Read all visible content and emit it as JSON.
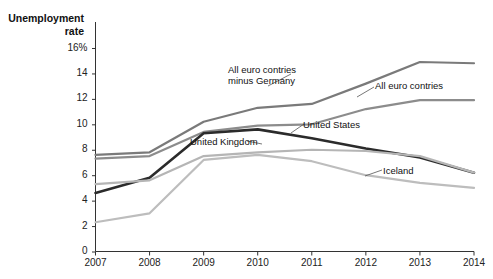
{
  "top_partial_text": "",
  "axis_title": {
    "line1": "Unemployment",
    "line2": "rate"
  },
  "chart_data": {
    "type": "line",
    "title": "",
    "subtitle": "",
    "xlabel": "",
    "ylabel": "Unemployment rate",
    "x": [
      2007,
      2008,
      2009,
      2010,
      2011,
      2012,
      2013,
      2014
    ],
    "xtick_labels": [
      "2007",
      "2008",
      "2009",
      "2010",
      "2011",
      "2012",
      "2013",
      "2014"
    ],
    "ytick_labels": [
      "0",
      "2",
      "4",
      "6",
      "8",
      "10",
      "12",
      "14",
      "16%"
    ],
    "ytick_values": [
      0,
      2,
      4,
      6,
      8,
      10,
      12,
      14,
      16
    ],
    "ylim": [
      0,
      16.8
    ],
    "xlim": [
      2007,
      2014
    ],
    "grid": false,
    "legend": "inline-annotations",
    "series": [
      {
        "name": "All euro contries minus Germany",
        "color": "#7a7a7a",
        "values": [
          7.6,
          7.8,
          10.2,
          11.3,
          11.6,
          13.2,
          14.9,
          14.8
        ]
      },
      {
        "name": "All euro contries",
        "color": "#8c8c8c",
        "values": [
          7.3,
          7.5,
          9.4,
          9.9,
          10.0,
          11.2,
          11.9,
          11.9
        ]
      },
      {
        "name": "United States",
        "color": "#2b2b2b",
        "values": [
          4.6,
          5.8,
          9.3,
          9.6,
          8.9,
          8.1,
          7.4,
          6.2
        ]
      },
      {
        "name": "United Kingdom",
        "color": "#b5b5b5",
        "values": [
          5.3,
          5.6,
          7.5,
          7.8,
          8.0,
          7.9,
          7.5,
          6.2
        ]
      },
      {
        "name": "Iceland",
        "color": "#bdbdbd",
        "values": [
          2.3,
          3.0,
          7.2,
          7.6,
          7.1,
          6.0,
          5.4,
          5.0
        ]
      }
    ],
    "annotations": [
      {
        "text_line1": "All euro contries",
        "text_line2": "minus Germany",
        "target_series": "All euro contries minus Germany"
      },
      {
        "text_line1": "All euro contries",
        "text_line2": "",
        "target_series": "All euro contries"
      },
      {
        "text_line1": "United States",
        "text_line2": "",
        "target_series": "United States"
      },
      {
        "text_line1": "United Kingdom",
        "text_line2": "",
        "target_series": "United Kingdom"
      },
      {
        "text_line1": "Iceland",
        "text_line2": "",
        "target_series": "Iceland"
      }
    ]
  }
}
